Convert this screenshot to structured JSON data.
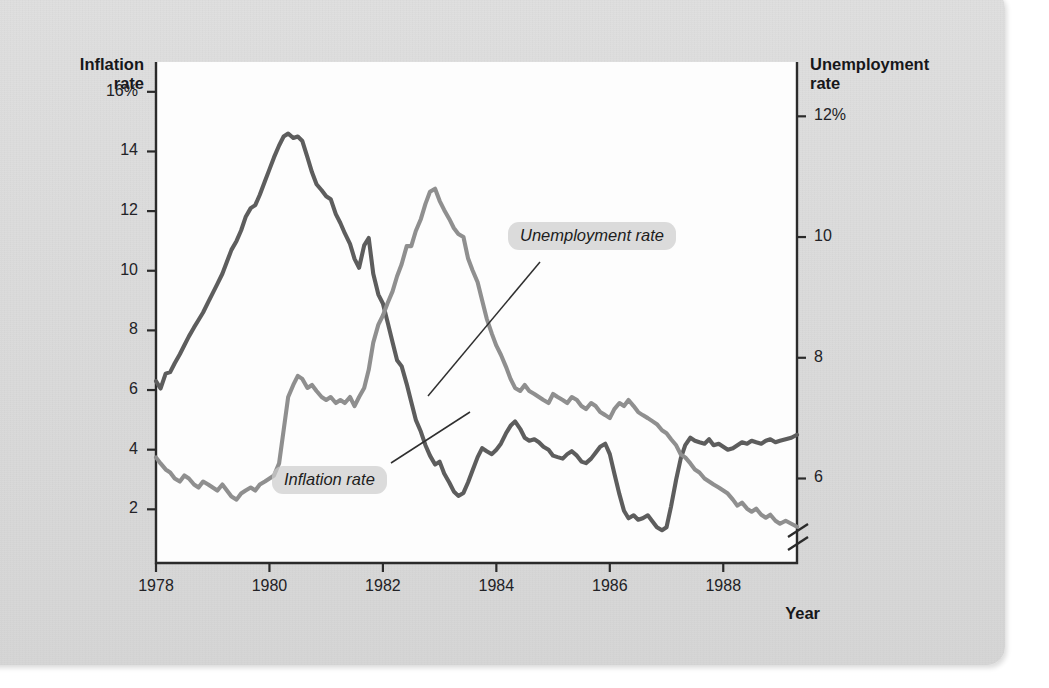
{
  "figure": {
    "left_axis_title": "Inflation\nrate",
    "right_axis_title": "Unemployment\nrate",
    "x_axis_title": "Year",
    "callout_inflation": "Inflation rate",
    "callout_unemployment": "Unemployment rate",
    "colors": {
      "inflation_line": "#5d5d5d",
      "unemployment_line": "#8f8f8f",
      "axis": "#2b2b2b",
      "plot_background": "#fdfdfd",
      "page_background": "#dcdcdc",
      "callout_background": "#cdcdcd"
    }
  },
  "ghost_text": [
    {
      "t": "makes it impossible for",
      "x": 196,
      "y": 70
    },
    {
      "t": "to reduce inflation",
      "x": 418,
      "y": 68
    },
    {
      "t": "and",
      "x": 300,
      "y": 93
    },
    {
      "t": "make",
      "x": 460,
      "y": 92
    },
    {
      "t": "unemployment",
      "x": 560,
      "y": 90
    },
    {
      "t": "by",
      "x": 690,
      "y": 90
    },
    {
      "t": "the short",
      "x": 180,
      "y": 118
    },
    {
      "t": "run",
      "x": 300,
      "y": 118
    },
    {
      "t": "the Federal Reserve",
      "x": 372,
      "y": 120
    },
    {
      "t": "allows the",
      "x": 236,
      "y": 145
    },
    {
      "t": "inflation",
      "x": 370,
      "y": 146
    },
    {
      "t": "and a",
      "x": 498,
      "y": 144
    },
    {
      "t": "recession",
      "x": 590,
      "y": 145
    },
    {
      "t": "unemployment",
      "x": 430,
      "y": 172
    },
    {
      "t": "can bring",
      "x": 600,
      "y": 170
    },
    {
      "t": "the economy back",
      "x": 240,
      "y": 357
    },
    {
      "t": "toward inflation",
      "x": 460,
      "y": 356
    },
    {
      "t": "in the long run and reduces the rate of",
      "x": 180,
      "y": 382
    },
    {
      "t": "inflation expectations",
      "x": 600,
      "y": 382
    },
    {
      "t": "expansion",
      "x": 210,
      "y": 432
    },
    {
      "t": "in the short run",
      "x": 420,
      "y": 430
    },
    {
      "t": "rising unemployment and",
      "x": 620,
      "y": 502
    },
    {
      "t": "the Fed wants",
      "x": 200,
      "y": 505
    },
    {
      "t": "to bring",
      "x": 400,
      "y": 505
    }
  ],
  "chart_data": {
    "type": "line",
    "title": "",
    "xlabel": "Year",
    "ylabel": "Inflation rate",
    "y2label": "Unemployment rate",
    "xlim": [
      1978.0,
      1989.3
    ],
    "xticks": [
      1978,
      1980,
      1982,
      1984,
      1986,
      1988
    ],
    "xticklabels": [
      "1978",
      "1980",
      "1982",
      "1984",
      "1986",
      "1988"
    ],
    "ylim": [
      0.2,
      17.0
    ],
    "yticks": [
      2,
      4,
      6,
      8,
      10,
      12,
      14,
      16
    ],
    "yticklabels": [
      "2",
      "4",
      "6",
      "8",
      "10",
      "12",
      "14",
      "16%"
    ],
    "y2lim": [
      4.6,
      12.9
    ],
    "y2ticks": [
      6,
      8,
      10,
      12
    ],
    "y2ticklabels": [
      "6",
      "8",
      "10",
      "12%"
    ],
    "y2_axis_break": true,
    "grid": false,
    "legend": "inline-annotations",
    "annotations": [
      {
        "text": "Inflation rate",
        "x": 1982.1,
        "y": 3.0,
        "points_to_x": 1983.05,
        "points_to_y": 4.7
      },
      {
        "text": "Unemployment rate",
        "x": 1984.1,
        "y": 11.0,
        "points_to_x": 1983.78,
        "points_to_y": 8.5
      }
    ],
    "series": [
      {
        "name": "Inflation rate",
        "axis": "left",
        "color": "#5d5d5d",
        "x": [
          1978.0,
          1978.08,
          1978.17,
          1978.25,
          1978.33,
          1978.42,
          1978.5,
          1978.58,
          1978.67,
          1978.75,
          1978.83,
          1978.92,
          1979.0,
          1979.08,
          1979.17,
          1979.25,
          1979.33,
          1979.42,
          1979.5,
          1979.58,
          1979.67,
          1979.75,
          1979.83,
          1979.92,
          1980.0,
          1980.08,
          1980.17,
          1980.25,
          1980.33,
          1980.42,
          1980.5,
          1980.58,
          1980.67,
          1980.75,
          1980.83,
          1980.92,
          1981.0,
          1981.08,
          1981.17,
          1981.25,
          1981.33,
          1981.42,
          1981.5,
          1981.58,
          1981.67,
          1981.75,
          1981.83,
          1981.92,
          1982.0,
          1982.08,
          1982.17,
          1982.25,
          1982.33,
          1982.42,
          1982.5,
          1982.58,
          1982.67,
          1982.75,
          1982.83,
          1982.92,
          1983.0,
          1983.08,
          1983.17,
          1983.25,
          1983.33,
          1983.42,
          1983.5,
          1983.58,
          1983.67,
          1983.75,
          1983.83,
          1983.92,
          1984.0,
          1984.08,
          1984.17,
          1984.25,
          1984.33,
          1984.42,
          1984.5,
          1984.58,
          1984.67,
          1984.75,
          1984.83,
          1984.92,
          1985.0,
          1985.08,
          1985.17,
          1985.25,
          1985.33,
          1985.42,
          1985.5,
          1985.58,
          1985.67,
          1985.75,
          1985.83,
          1985.92,
          1986.0,
          1986.08,
          1986.17,
          1986.25,
          1986.33,
          1986.42,
          1986.5,
          1986.58,
          1986.67,
          1986.75,
          1986.83,
          1986.92,
          1987.0,
          1987.08,
          1987.17,
          1987.25,
          1987.33,
          1987.42,
          1987.5,
          1987.58,
          1987.67,
          1987.75,
          1987.83,
          1987.92,
          1988.0,
          1988.08,
          1988.17,
          1988.25,
          1988.33,
          1988.42,
          1988.5,
          1988.58,
          1988.67,
          1988.75,
          1988.83,
          1988.92,
          1989.0,
          1989.1,
          1989.2,
          1989.3
        ],
        "y": [
          6.3,
          6.05,
          6.55,
          6.6,
          6.9,
          7.2,
          7.5,
          7.8,
          8.1,
          8.35,
          8.6,
          8.95,
          9.25,
          9.55,
          9.9,
          10.3,
          10.7,
          11.0,
          11.35,
          11.8,
          12.1,
          12.2,
          12.55,
          13.0,
          13.4,
          13.8,
          14.2,
          14.5,
          14.6,
          14.45,
          14.5,
          14.35,
          13.8,
          13.3,
          12.9,
          12.7,
          12.5,
          12.4,
          11.9,
          11.6,
          11.25,
          10.9,
          10.4,
          10.1,
          10.85,
          11.1,
          9.9,
          9.2,
          8.9,
          8.3,
          7.6,
          7.0,
          6.8,
          6.2,
          5.6,
          5.0,
          4.6,
          4.15,
          3.8,
          3.5,
          3.6,
          3.2,
          2.9,
          2.6,
          2.45,
          2.55,
          2.9,
          3.3,
          3.75,
          4.05,
          3.95,
          3.85,
          4.0,
          4.2,
          4.55,
          4.8,
          4.95,
          4.7,
          4.4,
          4.3,
          4.35,
          4.25,
          4.1,
          4.0,
          3.8,
          3.75,
          3.7,
          3.85,
          3.95,
          3.8,
          3.6,
          3.55,
          3.7,
          3.9,
          4.1,
          4.2,
          3.85,
          3.2,
          2.5,
          1.95,
          1.7,
          1.8,
          1.65,
          1.7,
          1.8,
          1.6,
          1.4,
          1.3,
          1.4,
          2.1,
          3.0,
          3.7,
          4.15,
          4.4,
          4.3,
          4.25,
          4.2,
          4.35,
          4.15,
          4.2,
          4.1,
          4.0,
          4.05,
          4.15,
          4.25,
          4.2,
          4.3,
          4.25,
          4.2,
          4.3,
          4.35,
          4.25,
          4.3,
          4.35,
          4.4,
          4.5
        ]
      },
      {
        "name": "Unemployment rate",
        "axis": "right",
        "color": "#8f8f8f",
        "x": [
          1978.0,
          1978.08,
          1978.17,
          1978.25,
          1978.33,
          1978.42,
          1978.5,
          1978.58,
          1978.67,
          1978.75,
          1978.83,
          1978.92,
          1979.0,
          1979.08,
          1979.17,
          1979.25,
          1979.33,
          1979.42,
          1979.5,
          1979.58,
          1979.67,
          1979.75,
          1979.83,
          1979.92,
          1980.0,
          1980.08,
          1980.17,
          1980.25,
          1980.33,
          1980.42,
          1980.5,
          1980.58,
          1980.67,
          1980.75,
          1980.83,
          1980.92,
          1981.0,
          1981.08,
          1981.17,
          1981.25,
          1981.33,
          1981.42,
          1981.5,
          1981.58,
          1981.67,
          1981.75,
          1981.83,
          1981.92,
          1982.0,
          1982.08,
          1982.17,
          1982.25,
          1982.33,
          1982.42,
          1982.5,
          1982.58,
          1982.67,
          1982.75,
          1982.83,
          1982.92,
          1983.0,
          1983.08,
          1983.17,
          1983.25,
          1983.33,
          1983.42,
          1983.5,
          1983.58,
          1983.67,
          1983.75,
          1983.83,
          1983.92,
          1984.0,
          1984.08,
          1984.17,
          1984.25,
          1984.33,
          1984.42,
          1984.5,
          1984.58,
          1984.67,
          1984.75,
          1984.83,
          1984.92,
          1985.0,
          1985.08,
          1985.17,
          1985.25,
          1985.33,
          1985.42,
          1985.5,
          1985.58,
          1985.67,
          1985.75,
          1985.83,
          1985.92,
          1986.0,
          1986.08,
          1986.17,
          1986.25,
          1986.33,
          1986.42,
          1986.5,
          1986.58,
          1986.67,
          1986.75,
          1986.83,
          1986.92,
          1987.0,
          1987.08,
          1987.17,
          1987.25,
          1987.33,
          1987.42,
          1987.5,
          1987.58,
          1987.67,
          1987.75,
          1987.83,
          1987.92,
          1988.0,
          1988.08,
          1988.17,
          1988.25,
          1988.33,
          1988.42,
          1988.5,
          1988.58,
          1988.67,
          1988.75,
          1988.83,
          1988.92,
          1989.0,
          1989.1,
          1989.2,
          1989.3
        ],
        "y": [
          6.35,
          6.25,
          6.15,
          6.1,
          6.0,
          5.95,
          6.05,
          6.0,
          5.9,
          5.85,
          5.95,
          5.9,
          5.85,
          5.8,
          5.9,
          5.8,
          5.7,
          5.65,
          5.75,
          5.8,
          5.85,
          5.8,
          5.9,
          5.95,
          6.0,
          6.05,
          6.25,
          6.8,
          7.35,
          7.55,
          7.7,
          7.65,
          7.5,
          7.55,
          7.45,
          7.35,
          7.3,
          7.35,
          7.25,
          7.3,
          7.25,
          7.35,
          7.2,
          7.35,
          7.5,
          7.8,
          8.25,
          8.55,
          8.7,
          8.9,
          9.1,
          9.35,
          9.55,
          9.85,
          9.85,
          10.1,
          10.3,
          10.55,
          10.75,
          10.8,
          10.6,
          10.45,
          10.3,
          10.15,
          10.05,
          10.0,
          9.65,
          9.45,
          9.25,
          8.95,
          8.65,
          8.4,
          8.2,
          8.05,
          7.85,
          7.65,
          7.5,
          7.45,
          7.55,
          7.45,
          7.4,
          7.35,
          7.3,
          7.25,
          7.4,
          7.35,
          7.3,
          7.25,
          7.35,
          7.3,
          7.2,
          7.15,
          7.25,
          7.2,
          7.1,
          7.05,
          7.0,
          7.15,
          7.25,
          7.2,
          7.3,
          7.2,
          7.1,
          7.05,
          7.0,
          6.95,
          6.9,
          6.8,
          6.75,
          6.65,
          6.55,
          6.4,
          6.35,
          6.25,
          6.15,
          6.1,
          6.0,
          5.95,
          5.9,
          5.85,
          5.8,
          5.75,
          5.65,
          5.55,
          5.6,
          5.5,
          5.45,
          5.5,
          5.4,
          5.35,
          5.4,
          5.3,
          5.25,
          5.3,
          5.25,
          5.2
        ]
      }
    ]
  }
}
